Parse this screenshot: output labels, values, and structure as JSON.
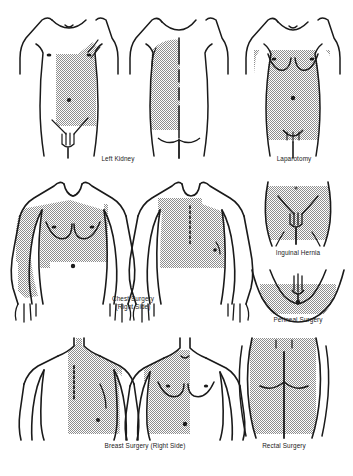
{
  "document": {
    "type": "medical-illustration",
    "subject": "Post-operative treatment areas by surgical procedure",
    "shade_color": "#a8a8a8",
    "outline_color": "#1a1a1a",
    "background_color": "#ffffff"
  },
  "figures": [
    {
      "id": "left-kidney",
      "label": "Left Kidney",
      "row": 1,
      "views": [
        "anterior-male-torso",
        "posterior-male-torso"
      ],
      "shaded_region": "left flank, anterior and posterior, from costal margin to iliac crest",
      "markings": [
        "umbilicus",
        "nipples",
        "suprapubic-hair",
        "midline-posterior-incision"
      ]
    },
    {
      "id": "laparotomy",
      "label": "Laparotomy",
      "row": 1,
      "views": [
        "anterior-female-torso"
      ],
      "shaded_region": "entire anterior abdomen and lower chest",
      "markings": [
        "umbilicus",
        "breasts",
        "nipples",
        "suprapubic-hair"
      ]
    },
    {
      "id": "chest-surgery",
      "label": "Chest Surgery",
      "sublabel": "(Right Side)",
      "row": 2,
      "views": [
        "anterior-male-upper-body",
        "posterior-male-upper-body"
      ],
      "shaded_region": "right hemithorax front and back including flank",
      "markings": [
        "nipples",
        "umbilicus",
        "suprasternal-notch",
        "posterior-midline-incision"
      ]
    },
    {
      "id": "inguinal-hernia",
      "label": "Inguinal Hernia",
      "row": 2,
      "views": [
        "anterior-pelvis"
      ],
      "shaded_region": "lower abdomen and both groins",
      "markings": [
        "inguinal-crease-lines",
        "pubic-hair"
      ]
    },
    {
      "id": "perineal-surgery",
      "label": "Perineal Surgery",
      "row": 2,
      "views": [
        "lithotomy-perineum"
      ],
      "shaded_region": "perineum, buttocks and medial thighs",
      "markings": [
        "perineum",
        "anus",
        "pubic-hair"
      ]
    },
    {
      "id": "breast-surgery",
      "label": "Breast Surgery (Right Side)",
      "row": 3,
      "views": [
        "posterior-male-upper-body",
        "anterior-male-upper-body"
      ],
      "shaded_region": "right side of back and right chest to midline",
      "markings": [
        "posterior-midline-incision",
        "scapula",
        "nipples",
        "umbilicus",
        "suprasternal-notch"
      ]
    },
    {
      "id": "rectal-surgery",
      "label": "Rectal Surgery",
      "row": 3,
      "views": [
        "posterior-buttocks"
      ],
      "shaded_region": "both buttocks and sacral area",
      "markings": [
        "natal-cleft",
        "gluteal-fold"
      ]
    }
  ]
}
